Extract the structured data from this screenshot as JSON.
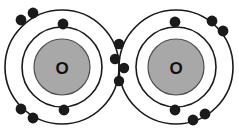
{
  "figure": {
    "type": "atomic-bonding-diagram",
    "width": 239,
    "height": 134,
    "background_color": "#ffffff"
  },
  "style": {
    "stroke_color": "#1a1a1a",
    "nucleus_fill": "#a8a8a8",
    "nucleus_stroke": "#4d4d4d",
    "electron_fill": "#1a1a1a",
    "shell_fill": "#ffffff",
    "label_color": "#111111",
    "shell_stroke_width": 1.6,
    "electron_radius": 5.4,
    "shared_electron_radius": 5.2
  },
  "atoms": [
    {
      "id": "atom-left",
      "element_symbol": "O",
      "nucleus_label": "O",
      "center": {
        "x": 62,
        "y": 67
      },
      "nucleus_radius": 28,
      "shells": [
        {
          "name": "inner-shell",
          "radius": 40
        },
        {
          "name": "outer-shell",
          "radius": 57
        }
      ],
      "electrons": [
        {
          "shell": "inner-shell",
          "x": 63,
          "y": 24
        },
        {
          "shell": "inner-shell",
          "x": 64,
          "y": 110
        },
        {
          "shell": "outer-shell",
          "x": 21,
          "y": 20
        },
        {
          "shell": "outer-shell",
          "x": 33,
          "y": 13
        },
        {
          "shell": "outer-shell",
          "x": 21,
          "y": 109
        },
        {
          "shell": "outer-shell",
          "x": 33,
          "y": 118
        }
      ]
    },
    {
      "id": "atom-right",
      "element_symbol": "O",
      "nucleus_label": "O",
      "center": {
        "x": 176,
        "y": 67
      },
      "nucleus_radius": 28,
      "shells": [
        {
          "name": "inner-shell",
          "radius": 40
        },
        {
          "name": "outer-shell",
          "radius": 57
        }
      ],
      "electrons": [
        {
          "shell": "inner-shell",
          "x": 175,
          "y": 22
        },
        {
          "shell": "inner-shell",
          "x": 175,
          "y": 110
        },
        {
          "shell": "outer-shell",
          "x": 212,
          "y": 21
        },
        {
          "shell": "outer-shell",
          "x": 223,
          "y": 31
        },
        {
          "shell": "outer-shell",
          "x": 205,
          "y": 114
        },
        {
          "shell": "outer-shell",
          "x": 193,
          "y": 120
        }
      ]
    }
  ],
  "shared_electrons": [
    {
      "id": "shared-1",
      "x": 119,
      "y": 44
    },
    {
      "id": "shared-2",
      "x": 115,
      "y": 59
    },
    {
      "id": "shared-3",
      "x": 124,
      "y": 68
    },
    {
      "id": "shared-4",
      "x": 119,
      "y": 81
    }
  ],
  "bond": {
    "name": "double-covalent-bond",
    "shared_pair_count": 2,
    "total_shared_electrons": 4
  },
  "labels": {
    "left_nucleus": "O",
    "right_nucleus": "O"
  }
}
